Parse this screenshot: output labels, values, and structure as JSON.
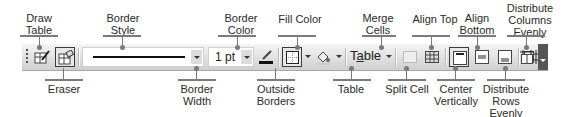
{
  "toolbar": {
    "name": "Tables and Borders",
    "border_style_value": "————————",
    "border_width_value": "1 pt",
    "table_menu_prefix": "T",
    "table_menu_underlined": "a",
    "table_menu_suffix": "ble",
    "buttons": [
      {
        "id": "draw-table",
        "icon": "pencil-table-icon",
        "active": false
      },
      {
        "id": "eraser",
        "icon": "eraser-icon",
        "active": true
      },
      {
        "id": "border-color",
        "icon": "pen-color-icon",
        "active": false
      },
      {
        "id": "outside-borders",
        "icon": "outside-borders-icon",
        "active": true
      },
      {
        "id": "fill-color",
        "icon": "paint-bucket-icon",
        "active": false
      },
      {
        "id": "merge-cells",
        "icon": "merge-cells-icon",
        "active": false
      },
      {
        "id": "split-cell",
        "icon": "split-cell-icon",
        "active": false
      },
      {
        "id": "align-top",
        "icon": "align-top-icon",
        "active": true
      },
      {
        "id": "center-vertically",
        "icon": "center-vertically-icon",
        "active": false
      },
      {
        "id": "align-bottom",
        "icon": "align-bottom-icon",
        "active": false
      },
      {
        "id": "distribute-rows",
        "icon": "distribute-rows-icon",
        "active": false
      },
      {
        "id": "distribute-columns",
        "icon": "distribute-columns-icon",
        "active": false
      }
    ]
  },
  "callouts_top": {
    "draw_table": [
      "Draw",
      "Table"
    ],
    "border_style": [
      "Border",
      "Style"
    ],
    "border_color": [
      "Border",
      "Color"
    ],
    "fill_color": [
      "Fill Color"
    ],
    "merge_cells": [
      "Merge",
      "Cells"
    ],
    "align_top": [
      "Align Top"
    ],
    "align_bottom": [
      "Align",
      "Bottom"
    ],
    "distribute_columns": [
      "Distribute",
      "Columns",
      "Evenly"
    ]
  },
  "callouts_bottom": {
    "eraser": [
      "Eraser"
    ],
    "border_width": [
      "Border",
      "Width"
    ],
    "outside_borders": [
      "Outside",
      "Borders"
    ],
    "table": [
      "Table"
    ],
    "split_cell": [
      "Split Cell"
    ],
    "center_vertically": [
      "Center",
      "Vertically"
    ],
    "distribute_rows": [
      "Distribute",
      "Rows",
      "Evenly"
    ]
  },
  "colors": {
    "toolbar_light": "#f4f4f4",
    "toolbar_dark": "#cfcfcf",
    "leader": "#7a7a7a",
    "text": "#2a2a2a"
  }
}
